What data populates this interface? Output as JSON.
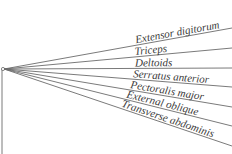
{
  "diagram": {
    "type": "cladogram-fan",
    "root_label": "",
    "leaves": [
      {
        "name": "Extensor digitorum"
      },
      {
        "name": "Triceps"
      },
      {
        "name": "Deltoids"
      },
      {
        "name": "Serratus anterior"
      },
      {
        "name": "Pectoralis major"
      },
      {
        "name": "External oblique"
      },
      {
        "name": "Transverse abdominis"
      }
    ],
    "colors": {
      "line": "#6b6b6b",
      "text": "#3a3a3a",
      "background": "#ffffff"
    }
  }
}
